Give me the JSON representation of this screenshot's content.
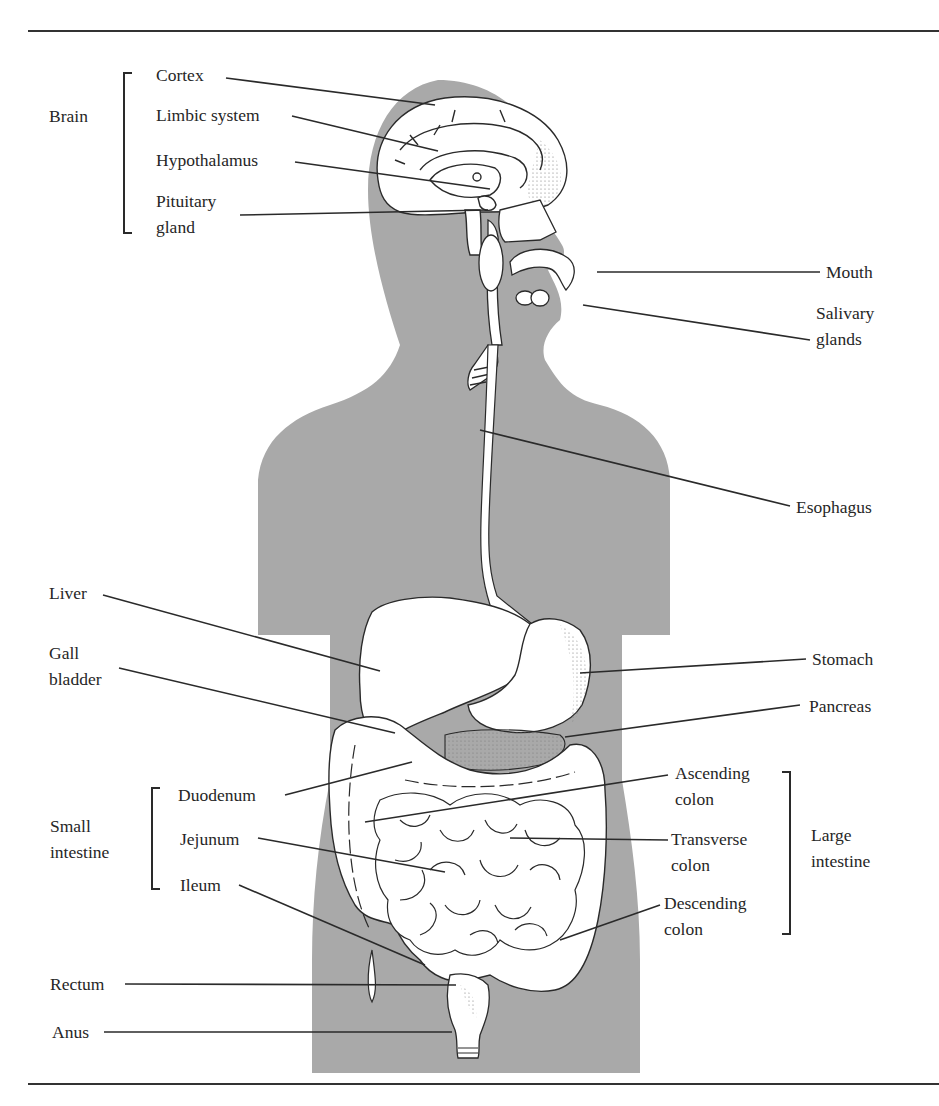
{
  "figure": {
    "silhouette_color": "#a9a9a9",
    "organ_fill": "#ffffff",
    "line_color": "#2a2a2a"
  },
  "groups": {
    "brain": "Brain",
    "small_intestine": "Small intestine",
    "large_intestine": "Large intestine"
  },
  "labels": {
    "cortex": "Cortex",
    "limbic_system": "Limbic system",
    "hypothalamus": "Hypothalamus",
    "pituitary_gland_1": "Pituitary",
    "pituitary_gland_2": "gland",
    "mouth": "Mouth",
    "salivary_glands_1": "Salivary",
    "salivary_glands_2": "glands",
    "esophagus": "Esophagus",
    "liver": "Liver",
    "gall_bladder_1": "Gall",
    "gall_bladder_2": "bladder",
    "stomach": "Stomach",
    "pancreas": "Pancreas",
    "duodenum": "Duodenum",
    "jejunum": "Jejunum",
    "ileum": "Ileum",
    "ascending_colon_1": "Ascending",
    "ascending_colon_2": "colon",
    "transverse_colon_1": "Transverse",
    "transverse_colon_2": "colon",
    "descending_colon_1": "Descending",
    "descending_colon_2": "colon",
    "rectum": "Rectum",
    "anus": "Anus",
    "small_intestine_1": "Small",
    "small_intestine_2": "intestine",
    "large_intestine_1": "Large",
    "large_intestine_2": "intestine"
  }
}
